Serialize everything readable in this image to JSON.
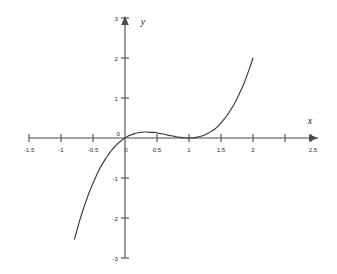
{
  "figure": {
    "background_color": "#ffffff",
    "line_color": "#3a3a3a",
    "axis_color": "#4a4a4a",
    "text_color": "#2b2b2b"
  },
  "axes": {
    "x_name": "x",
    "y_name": "y"
  },
  "chart_data": {
    "type": "line",
    "title": "",
    "subtitle": "",
    "xlabel": "x",
    "ylabel": "y",
    "xlim": [
      -1.5,
      2.5
    ],
    "ylim": [
      -3,
      3
    ],
    "grid": false,
    "legend": null,
    "axis_style": "cartesian-cross-with-arrows",
    "x_ticks": [
      -1.5,
      -1,
      -0.5,
      0,
      0.5,
      1,
      1.5,
      2,
      2.5
    ],
    "x_tick_labels": [
      "-1.5",
      "-1",
      "-0.5",
      "0",
      "0.5",
      "1",
      "1.5",
      "2",
      "2.5"
    ],
    "y_ticks": [
      -3,
      -2,
      -1,
      0,
      1,
      2,
      3
    ],
    "y_tick_labels": [
      "-3",
      "-2",
      "-1",
      "0",
      "1",
      "2",
      "3"
    ],
    "function": "y = x(x-1)^2",
    "x_domain_drawn": [
      -0.79,
      2.0
    ],
    "series": [
      {
        "name": "y = x(x-1)^2",
        "x": [
          -0.79,
          -0.75,
          -0.7,
          -0.65,
          -0.6,
          -0.55,
          -0.5,
          -0.45,
          -0.4,
          -0.35,
          -0.3,
          -0.25,
          -0.2,
          -0.15,
          -0.1,
          -0.05,
          0.0,
          0.05,
          0.1,
          0.15,
          0.2,
          0.25,
          0.3,
          0.3333,
          0.35,
          0.4,
          0.45,
          0.5,
          0.55,
          0.6,
          0.65,
          0.7,
          0.75,
          0.8,
          0.85,
          0.9,
          0.95,
          1.0,
          1.05,
          1.1,
          1.15,
          1.2,
          1.25,
          1.3,
          1.35,
          1.4,
          1.45,
          1.5,
          1.55,
          1.6,
          1.65,
          1.7,
          1.75,
          1.8,
          1.85,
          1.9,
          1.95,
          2.0
        ],
        "y": [
          -2.53,
          -2.3,
          -2.02,
          -1.77,
          -1.54,
          -1.32,
          -1.13,
          -0.95,
          -0.78,
          -0.64,
          -0.51,
          -0.39,
          -0.29,
          -0.2,
          -0.12,
          -0.06,
          0.0,
          0.05,
          0.08,
          0.11,
          0.13,
          0.14,
          0.15,
          0.148,
          0.15,
          0.14,
          0.14,
          0.13,
          0.11,
          0.1,
          0.08,
          0.06,
          0.05,
          0.03,
          0.02,
          0.01,
          0.0,
          0.0,
          0.0,
          0.01,
          0.03,
          0.05,
          0.08,
          0.12,
          0.17,
          0.22,
          0.29,
          0.38,
          0.47,
          0.58,
          0.7,
          0.83,
          0.98,
          1.15,
          1.33,
          1.54,
          1.76,
          2.0
        ]
      }
    ],
    "key_points": [
      {
        "label": "origin / root",
        "x": 0,
        "y": 0
      },
      {
        "label": "local maximum",
        "x": 0.333,
        "y": 0.148
      },
      {
        "label": "double root / inflection touch",
        "x": 1,
        "y": 0
      },
      {
        "label": "right endpoint",
        "x": 2,
        "y": 2
      },
      {
        "label": "left endpoint",
        "x": -0.79,
        "y": -2.53
      }
    ]
  }
}
